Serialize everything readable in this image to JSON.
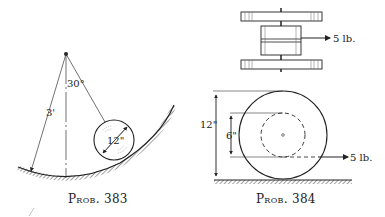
{
  "figures": [
    {
      "caption": "Prob. 383",
      "labels": {
        "radius": "3'",
        "angle": "30°",
        "diameter": "12\""
      }
    },
    {
      "caption": "Prob. 384",
      "labels": {
        "top_force": "5 lb.",
        "outer_diameter": "12\"",
        "inner_diameter": "6\"",
        "side_force": "5 lb."
      }
    }
  ]
}
